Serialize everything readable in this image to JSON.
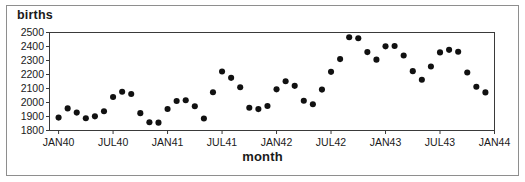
{
  "figure": {
    "ylabel": "births",
    "xlabel": "month"
  },
  "chart_data": {
    "type": "scatter",
    "title": "",
    "xlabel": "month",
    "ylabel": "births",
    "ylim": [
      1800,
      2500
    ],
    "ytick_labels": [
      "1800",
      "1900",
      "2000",
      "2100",
      "2200",
      "2300",
      "2400",
      "2500"
    ],
    "ytick_values": [
      1800,
      1900,
      2000,
      2100,
      2200,
      2300,
      2400,
      2500
    ],
    "xtick_labels": [
      "JAN40",
      "JUL40",
      "JAN41",
      "JUL41",
      "JAN42",
      "JUL42",
      "JAN43",
      "JUL43",
      "JAN44"
    ],
    "xtick_values": [
      0,
      6,
      12,
      18,
      24,
      30,
      36,
      42,
      48
    ],
    "xlim": [
      -1,
      48
    ],
    "grid": false,
    "legend": false,
    "marker": "filled-circle",
    "marker_color": "#111111",
    "x": [
      0,
      1,
      2,
      3,
      4,
      5,
      6,
      7,
      8,
      9,
      10,
      11,
      12,
      13,
      14,
      15,
      16,
      17,
      18,
      19,
      20,
      21,
      22,
      23,
      24,
      25,
      26,
      27,
      28,
      29,
      30,
      31,
      32,
      33,
      34,
      35,
      36,
      37,
      38,
      39,
      40,
      41,
      42,
      43,
      44,
      45,
      46,
      47
    ],
    "categories": [
      "JAN40",
      "FEB40",
      "MAR40",
      "APR40",
      "MAY40",
      "JUN40",
      "JUL40",
      "AUG40",
      "SEP40",
      "OCT40",
      "NOV40",
      "DEC40",
      "JAN41",
      "FEB41",
      "MAR41",
      "APR41",
      "MAY41",
      "JUN41",
      "JUL41",
      "AUG41",
      "SEP41",
      "OCT41",
      "NOV41",
      "DEC41",
      "JAN42",
      "FEB42",
      "MAR42",
      "APR42",
      "MAY42",
      "JUN42",
      "JUL42",
      "AUG42",
      "SEP42",
      "OCT42",
      "NOV42",
      "DEC42",
      "JAN43",
      "FEB43",
      "MAR43",
      "APR43",
      "MAY43",
      "JUN43",
      "JUL43",
      "AUG43",
      "SEP43",
      "OCT43",
      "NOV43",
      "DEC43"
    ],
    "values": [
      1892,
      1958,
      1928,
      1888,
      1901,
      1938,
      2039,
      2077,
      2061,
      1924,
      1859,
      1856,
      1954,
      2011,
      2016,
      1973,
      1886,
      2073,
      2221,
      2176,
      2109,
      1962,
      1953,
      1975,
      2094,
      2152,
      2119,
      2013,
      1988,
      2092,
      2219,
      2310,
      2466,
      2459,
      2360,
      2306,
      2401,
      2404,
      2336,
      2224,
      2162,
      2257,
      2358,
      2376,
      2362,
      2214,
      2112,
      2072
    ],
    "series": [
      {
        "name": "births",
        "values": [
          1892,
          1958,
          1928,
          1888,
          1901,
          1938,
          2039,
          2077,
          2061,
          1924,
          1859,
          1856,
          1954,
          2011,
          2016,
          1973,
          1886,
          2073,
          2221,
          2176,
          2109,
          1962,
          1953,
          1975,
          2094,
          2152,
          2119,
          2013,
          1988,
          2092,
          2219,
          2310,
          2466,
          2459,
          2360,
          2306,
          2401,
          2404,
          2336,
          2224,
          2162,
          2257,
          2358,
          2376,
          2362,
          2214,
          2112,
          2072
        ]
      }
    ]
  }
}
